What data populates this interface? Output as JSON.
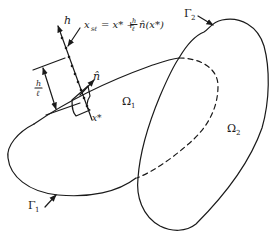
{
  "diagram": {
    "labels": {
      "h_axis": "h",
      "formula_lhs": "x",
      "formula_lhs_sub": "sℓ",
      "formula_rhs_prefix": "= x* +",
      "fraction_num": "h",
      "fraction_den": "ℓ",
      "formula_rhs_suffix": "n̂(x*)",
      "normal": "n̂",
      "point": "x*",
      "scale_num": "h",
      "scale_den": "ℓ",
      "omega1": "Ω",
      "omega1_sub": "1",
      "omega2": "Ω",
      "omega2_sub": "2",
      "gamma1": "Γ",
      "gamma1_sub": "1",
      "gamma2": "Γ",
      "gamma2_sub": "2"
    },
    "colors": {
      "line": "#1a1a1a",
      "background": "#ffffff"
    }
  }
}
